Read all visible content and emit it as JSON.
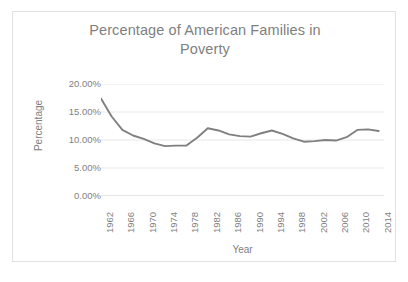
{
  "chart_data": {
    "type": "line",
    "title": "Percentage of American Families in Poverty",
    "title_lines": [
      "Percentage of American Families in",
      "Poverty"
    ],
    "xlabel": "Year",
    "ylabel": "Percentage",
    "ylim": [
      0,
      20
    ],
    "ytick_labels": [
      "0.00%",
      "5.00%",
      "10.00%",
      "15.00%",
      "20.00%"
    ],
    "ytick_values": [
      0,
      5,
      10,
      15,
      20
    ],
    "xtick_labels": [
      "1962",
      "1966",
      "1970",
      "1974",
      "1978",
      "1982",
      "1986",
      "1990",
      "1994",
      "1998",
      "2002",
      "2006",
      "2010",
      "2014"
    ],
    "xtick_values": [
      1962,
      1966,
      1970,
      1974,
      1978,
      1982,
      1986,
      1990,
      1994,
      1998,
      2002,
      2006,
      2010,
      2014
    ],
    "xlim": [
      1962,
      2015
    ],
    "grid": "horizontal",
    "legend": "none",
    "line_color": "#808080",
    "text_color": "#808080",
    "grid_color": "#e8e8e8",
    "border_color": "#e2e2e2",
    "background": "#ffffff",
    "series": [
      {
        "name": "Percentage of American Families in Poverty",
        "x": [
          1962,
          1964,
          1966,
          1968,
          1970,
          1972,
          1974,
          1976,
          1978,
          1980,
          1982,
          1984,
          1986,
          1988,
          1990,
          1992,
          1994,
          1996,
          1998,
          2000,
          2002,
          2004,
          2006,
          2008,
          2010,
          2012,
          2014
        ],
        "values": [
          17.4,
          14.2,
          11.8,
          10.8,
          10.2,
          9.4,
          8.9,
          9.0,
          9.0,
          10.4,
          12.1,
          11.7,
          11.0,
          10.7,
          10.6,
          11.2,
          11.7,
          11.1,
          10.3,
          9.7,
          9.8,
          10.0,
          9.9,
          10.5,
          11.8,
          11.9,
          11.6
        ]
      }
    ]
  }
}
